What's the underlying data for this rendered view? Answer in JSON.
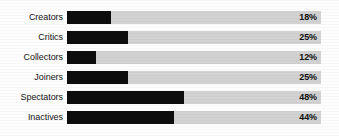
{
  "chart_data": {
    "type": "bar",
    "orientation": "horizontal",
    "title": "",
    "xlabel": "",
    "ylabel": "",
    "categories": [
      "Creators",
      "Critics",
      "Collectors",
      "Joiners",
      "Spectators",
      "Inactives"
    ],
    "values": [
      18,
      25,
      12,
      25,
      48,
      44
    ],
    "value_labels": [
      "18%",
      "25%",
      "12%",
      "25%",
      "48%",
      "44%"
    ],
    "unit": "%",
    "xlim": [
      0,
      104
    ],
    "grid": false,
    "legend": null,
    "bars": [
      {
        "label": "Creators",
        "value": 18,
        "value_label": "18%"
      },
      {
        "label": "Critics",
        "value": 25,
        "value_label": "25%"
      },
      {
        "label": "Collectors",
        "value": 12,
        "value_label": "12%"
      },
      {
        "label": "Joiners",
        "value": 25,
        "value_label": "25%"
      },
      {
        "label": "Spectators",
        "value": 48,
        "value_label": "48%"
      },
      {
        "label": "Inactives",
        "value": 44,
        "value_label": "44%"
      }
    ],
    "colors": {
      "bar_fill": "#0d0d0d",
      "track": "#d2d2d2",
      "background": "#fdfdfd",
      "label_text": "#151515",
      "value_text": "#101010"
    }
  }
}
